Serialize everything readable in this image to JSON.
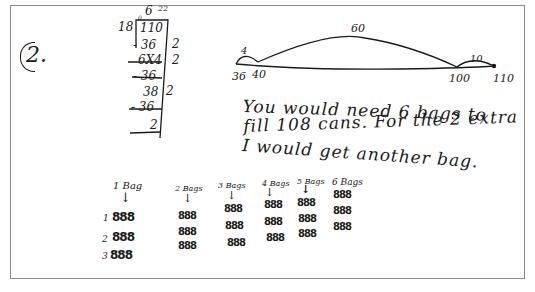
{
  "problem": {
    "number": "2."
  },
  "long_division": {
    "quotient_top": "6",
    "quotient_small": "22",
    "divisor": "18",
    "dividend": "110",
    "dividend_mark": "0",
    "steps": [
      {
        "text": "- 36",
        "side": "2"
      },
      {
        "text": "6X4",
        "side": "2"
      },
      {
        "text": "- 36",
        "side": ""
      },
      {
        "text": "38",
        "side": "2"
      },
      {
        "text": "- 36",
        "side": ""
      }
    ],
    "remainder": "2"
  },
  "number_line": {
    "points": [
      "36",
      "40",
      "100",
      "110"
    ],
    "jumps": [
      {
        "label": "4",
        "from": "36",
        "to": "40"
      },
      {
        "label": "60",
        "from": "40",
        "to": "100"
      },
      {
        "label": "10",
        "from": "100",
        "to": "110"
      }
    ]
  },
  "answer_text": {
    "line1": "You   would   need   6  bags   to",
    "line2": "fill  108  cans. For  the  2 extra",
    "line3": "I would   get   another   bag."
  },
  "bags": [
    {
      "label": "1 Bag",
      "rows": [
        "888",
        "888",
        "888"
      ],
      "row_numbers": [
        "1",
        "2",
        "3"
      ]
    },
    {
      "label": "2 Bags",
      "rows": [
        "888",
        "888",
        "888"
      ]
    },
    {
      "label": "3 Bags",
      "rows": [
        "888",
        "888",
        "888"
      ]
    },
    {
      "label": "4 Bags",
      "rows": [
        "888",
        "888",
        "888"
      ]
    },
    {
      "label": "5 Bags",
      "rows": [
        "888",
        "888",
        "888"
      ]
    },
    {
      "label": "6 Bags",
      "rows": [
        "888",
        "888",
        "888"
      ]
    }
  ],
  "arrow_glyph": "↓"
}
